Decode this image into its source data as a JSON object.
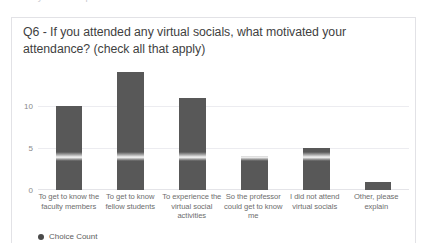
{
  "page": {
    "clipped_header_text": "survey results report continued — virtual socials"
  },
  "card": {
    "question": "Q6 - If you attended any virtual socials, what motivated your attendance? (check all that apply)"
  },
  "chart_data": {
    "type": "bar",
    "title": "Q6 - If you attended any virtual socials, what motivated your attendance? (check all that apply)",
    "xlabel": "",
    "ylabel": "",
    "categories": [
      "To get to know the faculty members",
      "To get to know fellow students",
      "To experience the virtual social activities",
      "So the professor could get to know me",
      "I did not attend virtual socials",
      "Other, please explain"
    ],
    "values": [
      10,
      14,
      11,
      4,
      5,
      1
    ],
    "series": [
      {
        "name": "Choice Count",
        "values": [
          10,
          14,
          11,
          4,
          5,
          1
        ]
      }
    ],
    "ylim": [
      0,
      15
    ],
    "yticks": [
      0,
      5,
      10
    ],
    "ytick_labels": [
      "0",
      "5",
      "10"
    ],
    "grid": true,
    "legend": {
      "position": "bottom-left",
      "entries": [
        {
          "label": "Choice Count",
          "marker": "circle",
          "color": "#4a4a4a"
        }
      ]
    },
    "bar_color": "#585858"
  }
}
